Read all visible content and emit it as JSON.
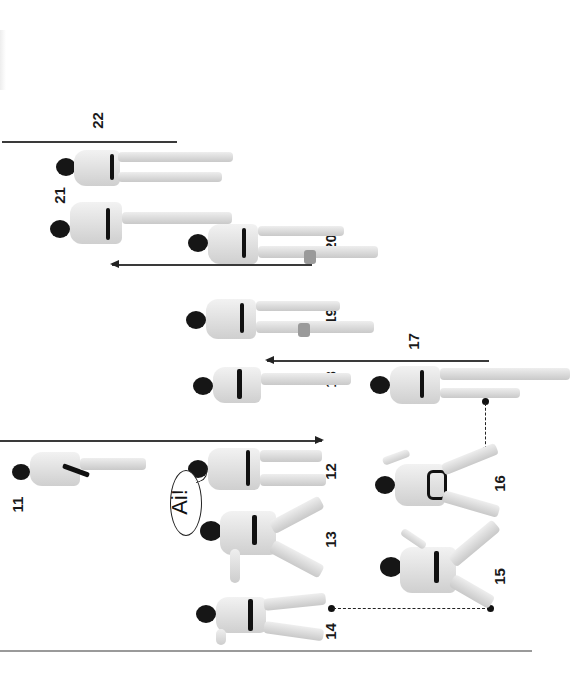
{
  "page": {
    "type": "karate kata step sequence (printed page, rotated 90°)",
    "background": "#ffffff",
    "ink_color": "#1a1a1a"
  },
  "steps": [
    {
      "id": "11",
      "label": "11"
    },
    {
      "id": "12",
      "label": "12"
    },
    {
      "id": "13",
      "label": "13"
    },
    {
      "id": "14",
      "label": "14"
    },
    {
      "id": "15",
      "label": "15"
    },
    {
      "id": "16",
      "label": "16"
    },
    {
      "id": "17",
      "label": "17"
    },
    {
      "id": "18",
      "label": "18"
    },
    {
      "id": "19",
      "label": "19"
    },
    {
      "id": "20",
      "label": "20"
    },
    {
      "id": "21",
      "label": "21"
    },
    {
      "id": "22",
      "label": "22"
    }
  ],
  "kiai": {
    "text": "Ai!"
  }
}
